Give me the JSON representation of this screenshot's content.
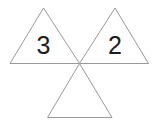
{
  "figure": {
    "background_color": "#ffffff",
    "stroke_color": "#9a9a9a",
    "stroke_width": 1,
    "label_color": "#1c1c1c",
    "label_font_size": 25,
    "canvas": {
      "width": 157,
      "height": 122
    },
    "shapes": [
      {
        "name": "left-triangle",
        "orientation": "up",
        "label": "3",
        "label_position": {
          "x": 43.5,
          "y": 54
        },
        "points": "43.5,8 79.5,63.5 10,63.5"
      },
      {
        "name": "right-triangle",
        "orientation": "up",
        "label": "2",
        "label_position": {
          "x": 115,
          "y": 54
        },
        "points": "115,8 148.5,63.5 79.5,63.5"
      },
      {
        "name": "bottom-triangle",
        "orientation": "up",
        "label": "",
        "label_position": {
          "x": 79.5,
          "y": 110
        },
        "points": "79.5,63.5 112,117.5 47.5,117.5"
      }
    ]
  }
}
